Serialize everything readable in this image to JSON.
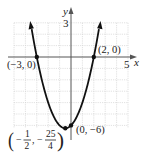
{
  "chart_data": {
    "type": "line",
    "title": "",
    "function": "y = x^2 + x - 6",
    "xlabel": "x",
    "ylabel": "y",
    "xlim": [
      -5,
      5
    ],
    "ylim": [
      -7,
      3
    ],
    "grid": true,
    "x_tick_labels": [
      {
        "value": 5,
        "label": "5"
      }
    ],
    "y_tick_labels": [
      {
        "value": 3,
        "label": "3"
      }
    ],
    "series": [
      {
        "name": "parabola",
        "x": [
          -3.5,
          -3,
          -2,
          -1,
          -0.5,
          0,
          1,
          2,
          2.5
        ],
        "y": [
          2.75,
          0,
          -4,
          -6,
          -6.25,
          -6,
          -4,
          0,
          2.75
        ]
      }
    ],
    "points": [
      {
        "x": -3,
        "y": 0,
        "label": "(-3, 0)"
      },
      {
        "x": 2,
        "y": 0,
        "label": "(2, 0)"
      },
      {
        "x": 0,
        "y": -6,
        "label": "(0, -6)"
      },
      {
        "x": -0.5,
        "y": -6.25,
        "label": "(-1/2, -25/4)"
      }
    ]
  },
  "labels": {
    "x_axis": "x",
    "y_axis": "y",
    "x_tick_5": "5",
    "y_tick_3": "3",
    "pt_left_intercept": "(−3, 0)",
    "pt_right_intercept": "(2, 0)",
    "pt_y_intercept": "(0, −6)",
    "vertex_open": "(",
    "vertex_minus1": "−",
    "vertex_num1": "1",
    "vertex_den1": "2",
    "vertex_comma": ",",
    "vertex_minus2": "−",
    "vertex_num2": "25",
    "vertex_den2": "4",
    "vertex_close": ")"
  },
  "colors": {
    "curve": "#111111",
    "axis": "#555555",
    "grid": "#d4d4d4"
  }
}
